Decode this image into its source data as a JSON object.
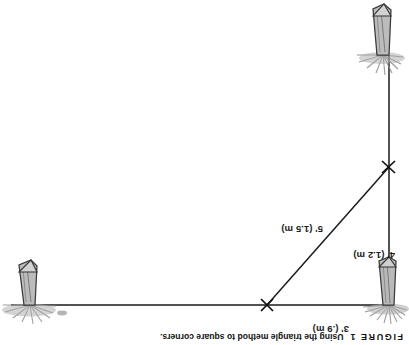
{
  "figure": {
    "caption_label": "FIGURE",
    "caption_number": "1",
    "caption_text": "Using the triangle method to square corners.",
    "orientation_note": "page-rotated-180",
    "background_color": "#ffffff",
    "line_color": "#1a1a1a",
    "stake_fill_color": "#b4b4b4",
    "stake_outline_color": "#3a3a3a"
  },
  "measurements": {
    "leg_vertical": "4' (1.2 m)",
    "leg_horizontal": "3' (.9 m)",
    "hypotenuse": "5' (1.5 m)"
  },
  "elements": {
    "stake_corner_name": "corner-stake",
    "stake_vertical_name": "vertical-line-stake",
    "stake_horizontal_name": "horizontal-line-stake",
    "tick_vertical_name": "vertical-measure-tick",
    "tick_horizontal_name": "horizontal-measure-tick",
    "string_vertical_name": "vertical-string-line",
    "string_horizontal_name": "horizontal-string-line",
    "string_hypotenuse_name": "hypotenuse-string-line"
  }
}
